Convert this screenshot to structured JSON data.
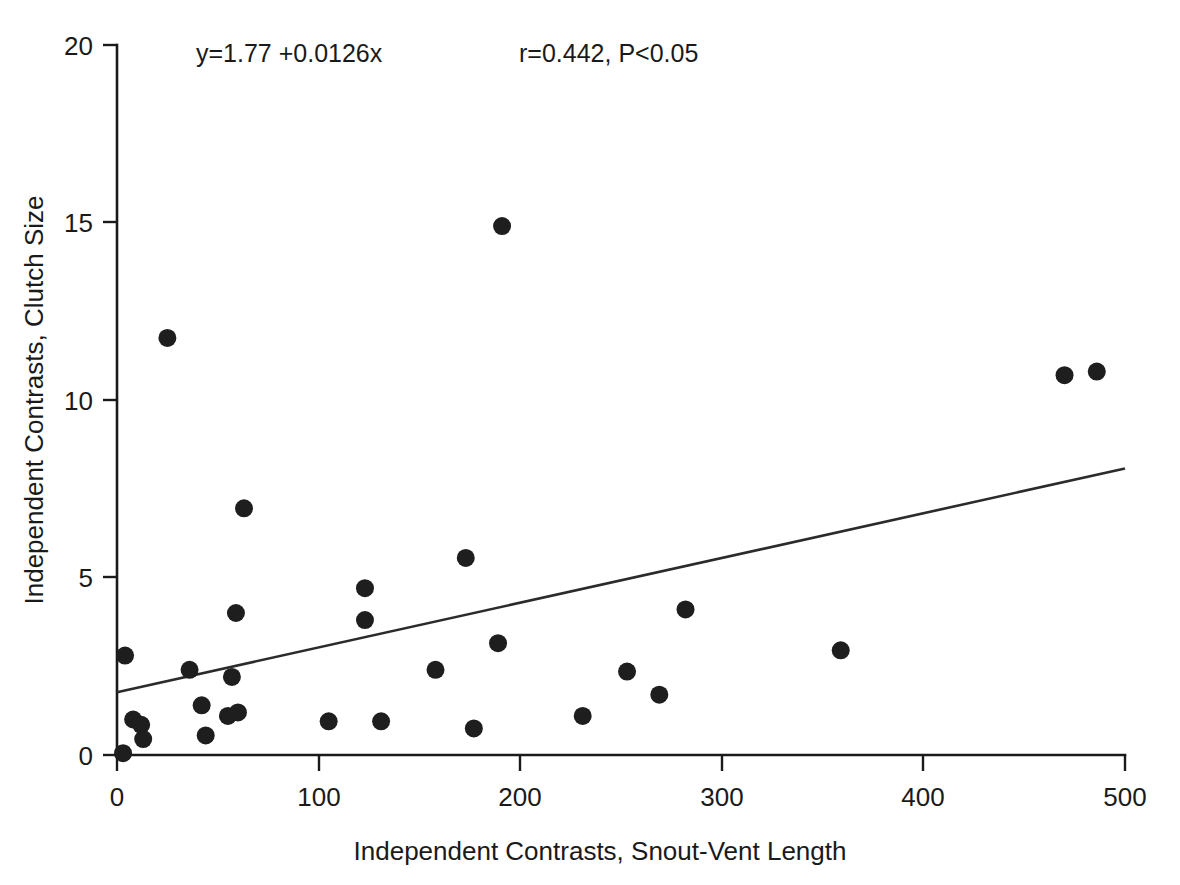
{
  "chart_data": {
    "type": "scatter",
    "title": "",
    "xlabel": "Independent Contrasts, Snout-Vent Length",
    "ylabel": "Independent Contrasts, Clutch Size",
    "xlim": [
      0,
      500
    ],
    "ylim": [
      0,
      20
    ],
    "xticks": [
      0,
      100,
      200,
      300,
      400,
      500
    ],
    "yticks": [
      0,
      5,
      10,
      15,
      20
    ],
    "xticklabels": [
      "0",
      "100",
      "200",
      "300",
      "400",
      "500"
    ],
    "yticklabels": [
      "0",
      "5",
      "10",
      "15",
      "20"
    ],
    "grid": false,
    "legend": false,
    "marker": "filled-circle",
    "marker_color": "#1e1e1e",
    "marker_size_px": 9,
    "points": [
      {
        "x": 3,
        "y": 0.05
      },
      {
        "x": 4,
        "y": 2.8
      },
      {
        "x": 8,
        "y": 1.0
      },
      {
        "x": 12,
        "y": 0.85
      },
      {
        "x": 13,
        "y": 0.45
      },
      {
        "x": 25,
        "y": 11.75
      },
      {
        "x": 36,
        "y": 2.4
      },
      {
        "x": 42,
        "y": 1.4
      },
      {
        "x": 44,
        "y": 0.55
      },
      {
        "x": 55,
        "y": 1.1
      },
      {
        "x": 57,
        "y": 2.2
      },
      {
        "x": 60,
        "y": 1.2
      },
      {
        "x": 59,
        "y": 4.0
      },
      {
        "x": 63,
        "y": 6.95
      },
      {
        "x": 105,
        "y": 0.95
      },
      {
        "x": 123,
        "y": 4.7
      },
      {
        "x": 123,
        "y": 3.8
      },
      {
        "x": 131,
        "y": 0.95
      },
      {
        "x": 158,
        "y": 2.4
      },
      {
        "x": 173,
        "y": 5.55
      },
      {
        "x": 177,
        "y": 0.75
      },
      {
        "x": 189,
        "y": 3.15
      },
      {
        "x": 191,
        "y": 14.9
      },
      {
        "x": 231,
        "y": 1.1
      },
      {
        "x": 253,
        "y": 2.35
      },
      {
        "x": 269,
        "y": 1.7
      },
      {
        "x": 282,
        "y": 4.1
      },
      {
        "x": 359,
        "y": 2.95
      },
      {
        "x": 470,
        "y": 10.7
      },
      {
        "x": 486,
        "y": 10.8
      }
    ],
    "fit_line": {
      "type": "linear-regression",
      "intercept": 1.77,
      "slope": 0.0126,
      "x_start": 0,
      "x_end": 500,
      "y_start": 1.77,
      "y_end": 8.07,
      "color": "#2b2b2b"
    },
    "annotations": [
      {
        "name": "equation",
        "text": "y=1.77 +0.0126x",
        "x_px": 196,
        "y_px": 62
      },
      {
        "name": "statistics",
        "text": "r=0.442, P<0.05",
        "x_px": 519,
        "y_px": 62
      }
    ],
    "axis_color": "#1a1a1a",
    "background": "#ffffff"
  }
}
